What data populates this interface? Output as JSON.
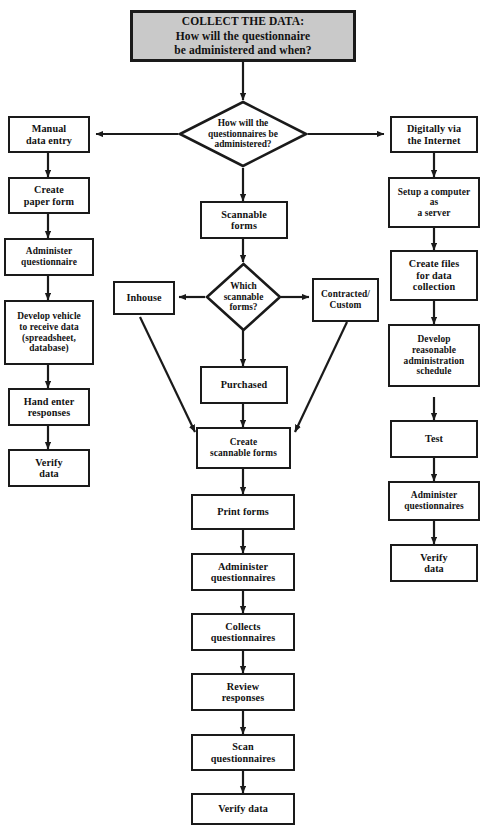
{
  "diagram": {
    "type": "flowchart",
    "title_box": {
      "line1": "COLLECT THE DATA:",
      "line2": "How will the questionnaire",
      "line3": "be administered and when?",
      "fill": "#c9c9c9",
      "stroke": "#1a1a1a"
    },
    "decisions": [
      {
        "id": "how-administered",
        "line1": "How will the",
        "line2": "questionnaires be",
        "line3": "administered?"
      },
      {
        "id": "which-scannable",
        "line1": "Which",
        "line2": "scannable",
        "line3": "forms?"
      }
    ],
    "branches": {
      "left_label": "Manual data entry",
      "center_label": "Scannable forms",
      "right_label": "Digitally via the Internet"
    },
    "left_column": [
      {
        "id": "manual-data-entry",
        "line1": "Manual",
        "line2": "data entry"
      },
      {
        "id": "create-paper-form",
        "line1": "Create",
        "line2": "paper form"
      },
      {
        "id": "administer-questionnaire",
        "line1": "Administer",
        "line2": "questionnaire"
      },
      {
        "id": "develop-vehicle",
        "line1": "Develop vehicle",
        "line2": "to receive data",
        "line3": "(spreadsheet,",
        "line4": "database)"
      },
      {
        "id": "hand-enter-responses",
        "line1": "Hand enter",
        "line2": "responses"
      },
      {
        "id": "verify-data-left",
        "line1": "Verify",
        "line2": "data"
      }
    ],
    "center_column": [
      {
        "id": "scannable-forms",
        "line1": "Scannable",
        "line2": "forms"
      },
      {
        "id": "purchased",
        "line1": "Purchased"
      },
      {
        "id": "create-scannable-forms",
        "line1": "Create",
        "line2": "scannable forms"
      },
      {
        "id": "print-forms",
        "line1": "Print forms"
      },
      {
        "id": "administer-questionnaires-center",
        "line1": "Administer",
        "line2": "questionnaires"
      },
      {
        "id": "collects-questionnaires",
        "line1": "Collects",
        "line2": "questionnaires"
      },
      {
        "id": "review-responses",
        "line1": "Review",
        "line2": "responses"
      },
      {
        "id": "scan-questionnaires",
        "line1": "Scan",
        "line2": "questionnaires"
      },
      {
        "id": "verify-data-center",
        "line1": "Verify data"
      }
    ],
    "side_options": [
      {
        "id": "inhouse",
        "line1": "Inhouse"
      },
      {
        "id": "contracted-custom",
        "line1": "Contracted/",
        "line2": "Custom"
      }
    ],
    "right_column": [
      {
        "id": "digitally-via-internet",
        "line1": "Digitally via",
        "line2": "the Internet"
      },
      {
        "id": "setup-computer-server",
        "line1": "Setup a computer",
        "line2": "as",
        "line3": "a server"
      },
      {
        "id": "create-files-data-collection",
        "line1": "Create files",
        "line2": "for data",
        "line3": "collection"
      },
      {
        "id": "develop-schedule",
        "line1": "Develop",
        "line2": "reasonable",
        "line3": "administration",
        "line4": "schedule"
      },
      {
        "id": "test",
        "line1": "Test"
      },
      {
        "id": "administer-questionnaires-right",
        "line1": "Administer",
        "line2": "questionnaires"
      },
      {
        "id": "verify-data-right",
        "line1": "Verify",
        "line2": "data"
      }
    ]
  }
}
